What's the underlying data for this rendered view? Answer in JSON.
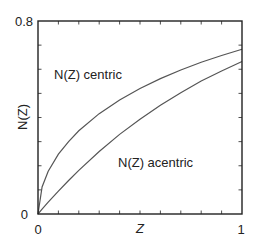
{
  "chart_data": {
    "type": "line",
    "title": "",
    "xlabel": "Z",
    "ylabel": "N(Z)",
    "xlim": [
      0,
      1
    ],
    "ylim": [
      0,
      0.8
    ],
    "x_tick_labels": [
      "0",
      "1"
    ],
    "y_tick_labels": [
      "0",
      "0.8"
    ],
    "x_minor_tick_step": 0.1,
    "y_minor_tick_step": 0.1,
    "grid": false,
    "legend": "inline annotations",
    "x": [
      0,
      0.02,
      0.05,
      0.1,
      0.15,
      0.2,
      0.3,
      0.4,
      0.5,
      0.6,
      0.7,
      0.8,
      0.9,
      1.0
    ],
    "series": [
      {
        "name": "N(Z) centric",
        "values": [
          0,
          0.112,
          0.177,
          0.248,
          0.3,
          0.345,
          0.416,
          0.473,
          0.52,
          0.561,
          0.597,
          0.629,
          0.657,
          0.683
        ]
      },
      {
        "name": "N(Z) acentric",
        "values": [
          0,
          0.02,
          0.049,
          0.095,
          0.139,
          0.181,
          0.259,
          0.33,
          0.393,
          0.451,
          0.503,
          0.551,
          0.593,
          0.632
        ]
      }
    ],
    "annotations": [
      {
        "text": "N(Z) centric",
        "x": 0.08,
        "y": 0.58
      },
      {
        "text": "N(Z) acentric",
        "x": 0.4,
        "y": 0.22
      }
    ],
    "line_color": "#555555",
    "axis_color": "#222222"
  }
}
